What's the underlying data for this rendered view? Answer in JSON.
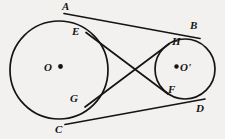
{
  "figure": {
    "type": "geometry-diagram",
    "background_color": "#f2f1ef",
    "stroke_color": "#141414",
    "canvas": {
      "width": 225,
      "height": 139
    },
    "circles": [
      {
        "id": "left-circle",
        "center_label": "O",
        "center_dot_side": "right",
        "cx": 59,
        "cy": 70,
        "r": 49
      },
      {
        "id": "right-circle",
        "center_label": "O'",
        "center_dot_side": "left",
        "cx": 185,
        "cy": 69,
        "r": 30
      }
    ],
    "points": [
      {
        "label": "A",
        "x": 66,
        "y": 14,
        "label_x": 62,
        "label_y": 1,
        "role": "external-tangent-point-left-upper"
      },
      {
        "label": "B",
        "x": 197,
        "y": 39,
        "label_x": 190,
        "label_y": 20,
        "role": "external-tangent-point-right-upper"
      },
      {
        "label": "C",
        "x": 67,
        "y": 124,
        "label_x": 55,
        "label_y": 124,
        "role": "external-tangent-point-left-lower"
      },
      {
        "label": "D",
        "x": 203,
        "y": 99,
        "label_x": 196,
        "label_y": 103,
        "role": "external-tangent-point-right-lower"
      },
      {
        "label": "E",
        "x": 89,
        "y": 34,
        "label_x": 72,
        "label_y": 26,
        "role": "internal-tangent-point-left-upper"
      },
      {
        "label": "F",
        "x": 166,
        "y": 92,
        "label_x": 168,
        "label_y": 84,
        "role": "internal-tangent-point-right-lower"
      },
      {
        "label": "G",
        "x": 88,
        "y": 105,
        "label_x": 70,
        "label_y": 93,
        "role": "internal-tangent-point-left-lower"
      },
      {
        "label": "H",
        "x": 166,
        "y": 46,
        "label_x": 172,
        "label_y": 36,
        "role": "internal-tangent-point-right-upper"
      }
    ],
    "center_labels": [
      {
        "label": "O",
        "x": 44,
        "y": 64
      },
      {
        "label": "O'",
        "x": 180,
        "y": 63
      }
    ],
    "center_dots": [
      {
        "x": 60,
        "y": 66
      },
      {
        "x": 176,
        "y": 66
      }
    ],
    "lines": [
      {
        "id": "tangent-AB",
        "from": "A",
        "to": "B",
        "kind": "external"
      },
      {
        "id": "tangent-CD",
        "from": "C",
        "to": "D",
        "kind": "external"
      },
      {
        "id": "tangent-EF",
        "from": "E",
        "to": "F",
        "kind": "internal"
      },
      {
        "id": "tangent-GH",
        "from": "G",
        "to": "H",
        "kind": "internal"
      }
    ],
    "intersection": {
      "id": "internal-tangent-crossing",
      "x": 139,
      "y": 70
    }
  },
  "bleed_through": {
    "text": "            "
  }
}
